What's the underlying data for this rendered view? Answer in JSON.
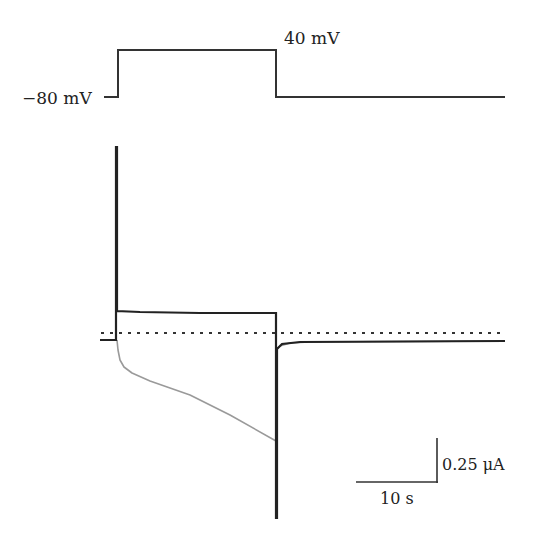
{
  "chart_data": {
    "type": "line",
    "title": "",
    "xlabel": "",
    "ylabel": "",
    "grid": false,
    "legend": "none",
    "voltage_protocol": {
      "holding_label": "−80 mV",
      "step_label": "40 mV",
      "holding_mV": -80,
      "step_mV": 40,
      "step_start_s": 0,
      "step_end_s": 31
    },
    "series": [
      {
        "name": "voltage-command",
        "color": "#333333",
        "points_px": [
          [
            104,
            97
          ],
          [
            118,
            97
          ],
          [
            118,
            50
          ],
          [
            276,
            50
          ],
          [
            276,
            97
          ],
          [
            505,
            97
          ]
        ]
      },
      {
        "name": "current-black",
        "color": "#222222",
        "points_px": [
          [
            100,
            340
          ],
          [
            116,
            340
          ],
          [
            116,
            147
          ],
          [
            117,
            147
          ],
          [
            117,
            311
          ],
          [
            140,
            312
          ],
          [
            200,
            313
          ],
          [
            275,
            313
          ],
          [
            276,
            313
          ],
          [
            276,
            518
          ],
          [
            277,
            518
          ],
          [
            277,
            349
          ],
          [
            282,
            344
          ],
          [
            300,
            342
          ],
          [
            505,
            341
          ]
        ]
      },
      {
        "name": "current-gray",
        "color": "#9a9a9a",
        "points_px": [
          [
            117,
            340
          ],
          [
            118,
            350
          ],
          [
            120,
            360
          ],
          [
            124,
            367
          ],
          [
            132,
            373
          ],
          [
            150,
            381
          ],
          [
            190,
            395
          ],
          [
            230,
            415
          ],
          [
            276,
            441
          ],
          [
            277,
            349
          ],
          [
            280,
            346
          ],
          [
            290,
            343
          ],
          [
            310,
            342
          ],
          [
            505,
            341
          ]
        ]
      },
      {
        "name": "zero-current-reference",
        "style": "dotted",
        "color": "#333333",
        "points_px": [
          [
            101,
            333
          ],
          [
            503,
            333
          ]
        ]
      }
    ],
    "scale_bars": {
      "time": {
        "label": "10 s",
        "value": 10,
        "unit": "s"
      },
      "current": {
        "label": "0.25 μA",
        "value": 0.25,
        "unit": "μA"
      }
    }
  }
}
